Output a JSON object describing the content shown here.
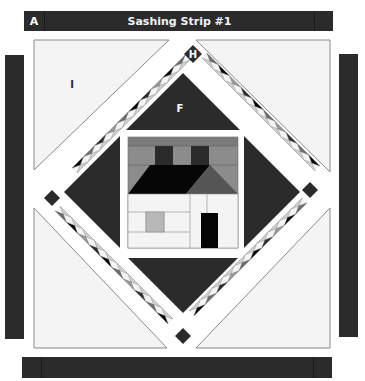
{
  "header": {
    "cap_label": "A",
    "title": "Sashing Strip #1"
  },
  "labels": {
    "corner_triangle": "I",
    "center_triangle": "F",
    "corner_square": "H"
  },
  "colors": {
    "dark": "#2b2b2b",
    "black": "#050505",
    "medium": "#6e6e6e",
    "mediumlight": "#9a9a9a",
    "light": "#cfcfcf",
    "pale": "#f4f4f4",
    "white": "#ffffff",
    "outline": "#8a8a8a"
  },
  "house": {
    "roof_left_color": "#050505",
    "roof_right_color": "#555555",
    "sky_color": "#8c8c8c",
    "chimney_color": "#2b2b2b",
    "wall_color": "#f4f4f4",
    "window_color": "#b8b8b8",
    "door_color": "#050505"
  }
}
